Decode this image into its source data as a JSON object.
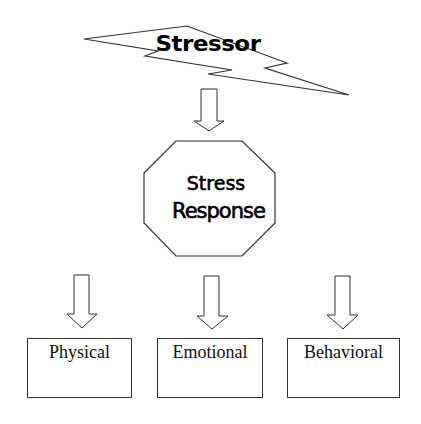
{
  "diagram": {
    "stressor": {
      "label": "Stressor",
      "shape": "lightning-bolt"
    },
    "arrow_main": {
      "direction": "down"
    },
    "response": {
      "line1": "Stress",
      "line2": "Response",
      "shape": "octagon"
    },
    "outcomes": [
      {
        "label": "Physical"
      },
      {
        "label": "Emotional"
      },
      {
        "label": "Behavioral"
      }
    ],
    "colors": {
      "stroke": "#333333",
      "fill": "#ffffff",
      "text": "#000000"
    }
  }
}
